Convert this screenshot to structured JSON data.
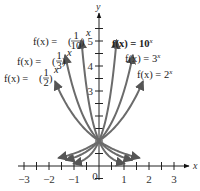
{
  "chart_data": {
    "type": "line",
    "title": "",
    "xlabel": "x",
    "ylabel": "y",
    "xlim": [
      -3,
      3
    ],
    "ylim": [
      0,
      5.5
    ],
    "grid": false,
    "x_ticks": [
      -3,
      -2,
      -1,
      0,
      1,
      2,
      3
    ],
    "x_tick_labels": [
      "−3",
      "−2",
      "−1",
      "0",
      "1",
      "2",
      "3"
    ],
    "y_ticks": [
      3,
      4,
      5
    ],
    "y_tick_labels": [
      "3",
      "4",
      "5"
    ],
    "minor_tick_step": 0.5,
    "series": [
      {
        "name": "f(x) = 10^x",
        "base": 10,
        "x_range": [
          -1.0,
          0.7
        ]
      },
      {
        "name": "f(x) = 3^x",
        "base": 3,
        "x_range": [
          -1.3,
          1.35
        ]
      },
      {
        "name": "f(x) = 2^x",
        "base": 2,
        "x_range": [
          -1.6,
          1.75
        ]
      },
      {
        "name": "f(x) = (1/10)^x",
        "base": 0.1,
        "x_range": [
          -0.7,
          1.0
        ]
      },
      {
        "name": "f(x) = (1/3)^x",
        "base": 0.3333,
        "x_range": [
          -1.35,
          1.3
        ]
      },
      {
        "name": "f(x) = (1/2)^x",
        "base": 0.5,
        "x_range": [
          -1.75,
          1.6
        ]
      }
    ],
    "annotations": [
      {
        "text": "f(x) = 10^x",
        "anchor": "right-top"
      },
      {
        "text": "f(x) = 3^x",
        "anchor": "right-middle"
      },
      {
        "text": "f(x) = 2^x",
        "anchor": "right-lower"
      },
      {
        "text": "f(x) = (1/10)^x",
        "anchor": "left-top"
      },
      {
        "text": "f(x) = (1/3)^x",
        "anchor": "left-middle"
      },
      {
        "text": "f(x) = (1/2)^x",
        "anchor": "left-lower"
      }
    ],
    "common_point": [
      0,
      1
    ]
  },
  "labels": {
    "x_axis": "x",
    "y_axis": "y",
    "fn_10": {
      "prefix": "f(x) = 10",
      "exp": "x"
    },
    "fn_3": {
      "prefix": "f(x) = 3",
      "exp": "x"
    },
    "fn_2": {
      "prefix": "f(x) = 2",
      "exp": "x"
    },
    "fn_tenth": {
      "prefix": "f(x) = ",
      "num": "1",
      "den": "10",
      "exp": "x"
    },
    "fn_third": {
      "prefix": "f(x) = ",
      "num": "1",
      "den": "3",
      "exp": "x"
    },
    "fn_half": {
      "prefix": "f(x) = ",
      "num": "1",
      "den": "2",
      "exp": "x"
    }
  }
}
